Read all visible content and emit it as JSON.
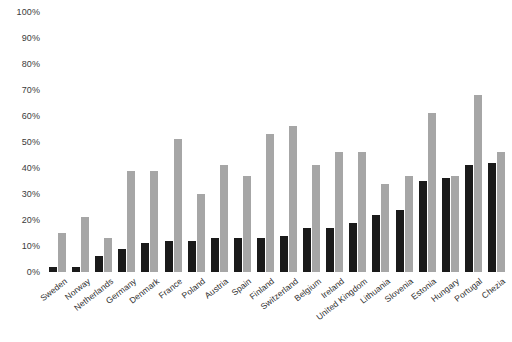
{
  "chart_data": {
    "type": "bar",
    "title": "",
    "subtitle": "",
    "xlabel": "",
    "ylabel": "",
    "ylim": [
      0,
      100
    ],
    "grid": false,
    "legend": "none",
    "y_ticks": [
      "0%",
      "10%",
      "20%",
      "30%",
      "40%",
      "50%",
      "60%",
      "70%",
      "80%",
      "90%",
      "100%"
    ],
    "y_tick_values": [
      0,
      10,
      20,
      30,
      40,
      50,
      60,
      70,
      80,
      90,
      100
    ],
    "categories": [
      "Sweden",
      "Norway",
      "Netherlands",
      "Germany",
      "Denmark",
      "France",
      "Poland",
      "Austria",
      "Spain",
      "Finland",
      "Switzerland",
      "Belgium",
      "Ireland",
      "United Kingdom",
      "Lithuania",
      "Slovenia",
      "Estonia",
      "Hungary",
      "Portugal",
      "Chezia"
    ],
    "series": [
      {
        "name": "dark",
        "color": "#1a1a1a",
        "values": [
          2,
          2,
          6,
          9,
          11,
          12,
          12,
          13,
          13,
          13,
          14,
          17,
          17,
          19,
          22,
          24,
          35,
          36,
          41,
          42
        ]
      },
      {
        "name": "light",
        "color": "#a6a6a6",
        "values": [
          15,
          21,
          13,
          39,
          39,
          51,
          30,
          41,
          37,
          53,
          56,
          41,
          46,
          46,
          34,
          37,
          61,
          37,
          68,
          46
        ]
      }
    ]
  }
}
